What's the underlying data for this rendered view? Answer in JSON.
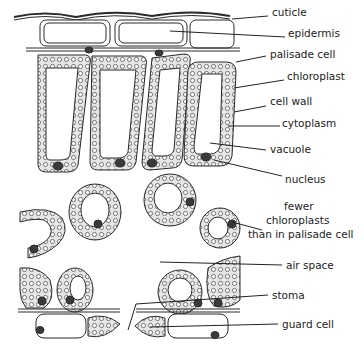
{
  "diagram": {
    "top_cutoff_text": "…cells of a leaf showing the structure of the tissues in it",
    "labels": [
      {
        "id": "cutticle",
        "text": "cuticle",
        "x": 272,
        "y": 12
      },
      {
        "id": "epidermis",
        "text": "epidermis",
        "x": 288,
        "y": 33
      },
      {
        "id": "palisade",
        "text": "palisade cell",
        "x": 270,
        "y": 54
      },
      {
        "id": "chloroplast",
        "text": "chloroplast",
        "x": 287,
        "y": 76
      },
      {
        "id": "cellwall",
        "text": "cell wall",
        "x": 270,
        "y": 101
      },
      {
        "id": "cytoplasm",
        "text": "cytoplasm",
        "x": 282,
        "y": 123
      },
      {
        "id": "vacuole",
        "text": "vacuole",
        "x": 270,
        "y": 145
      },
      {
        "id": "nucleus",
        "text": "nucleus",
        "x": 285,
        "y": 174
      },
      {
        "id": "fewer1",
        "text": "fewer",
        "x": 284,
        "y": 203
      },
      {
        "id": "fewer2",
        "text": "chloroplasts",
        "x": 266,
        "y": 218
      },
      {
        "id": "fewer3",
        "text": "than in palisade cell",
        "x": 248,
        "y": 233
      },
      {
        "id": "airspace",
        "text": "air space",
        "x": 286,
        "y": 259
      },
      {
        "id": "stoma",
        "text": "stoma",
        "x": 272,
        "y": 288
      },
      {
        "id": "guardcell",
        "text": "guard cell",
        "x": 282,
        "y": 317
      }
    ],
    "colors": {
      "line": "#2a2a2a",
      "cell_fill": "#ededed",
      "nucleus": "#3a3a3a"
    }
  }
}
